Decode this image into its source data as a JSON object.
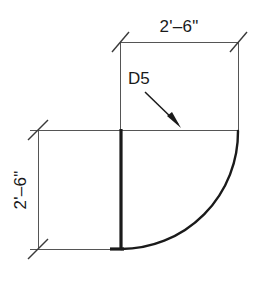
{
  "drawing": {
    "type": "architectural-door-plan-detail",
    "title_visible": false,
    "dimensions": {
      "top": {
        "label": "2'–6\"",
        "orientation": "horizontal",
        "position": "above-top-dimension-line"
      },
      "left": {
        "label": "2'–6\"",
        "orientation": "vertical-rotated",
        "position": "left-of-vertical-dimension-line"
      }
    },
    "tag": {
      "label": "D5",
      "leader": "arrow-pointing-down-right-to-door-header"
    },
    "colors": {
      "line_heavy": "#1a1a1a",
      "line_thin": "#555555",
      "background": "#ffffff",
      "text": "#1a1a1a"
    }
  }
}
